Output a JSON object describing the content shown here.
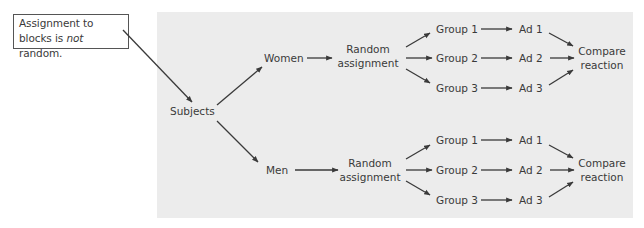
{
  "callout": {
    "text_before": "Assignment to blocks is ",
    "text_emphasis": "not",
    "text_after": " random."
  },
  "root": {
    "label": "Subjects"
  },
  "blocks": [
    {
      "label": "Women",
      "assignment": [
        "Random",
        "assignment"
      ],
      "groups": [
        {
          "group": "Group 1",
          "treatment": "Ad 1"
        },
        {
          "group": "Group 2",
          "treatment": "Ad 2"
        },
        {
          "group": "Group 3",
          "treatment": "Ad 3"
        }
      ],
      "outcome": [
        "Compare",
        "reaction"
      ]
    },
    {
      "label": "Men",
      "assignment": [
        "Random",
        "assignment"
      ],
      "groups": [
        {
          "group": "Group 1",
          "treatment": "Ad 1"
        },
        {
          "group": "Group 2",
          "treatment": "Ad 2"
        },
        {
          "group": "Group 3",
          "treatment": "Ad 3"
        }
      ],
      "outcome": [
        "Compare",
        "reaction"
      ]
    }
  ],
  "colors": {
    "panel": "#ececec",
    "text": "#3a3a3a",
    "callout_border": "#555555"
  }
}
